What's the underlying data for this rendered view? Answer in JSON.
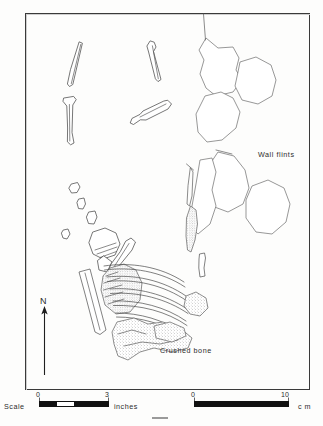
{
  "figure": {
    "type": "archaeological-site-plan",
    "title": "",
    "frame": {
      "x": 25,
      "y": 13,
      "width": 285,
      "height": 377
    }
  },
  "labels": {
    "wall_flints": "Wall flints",
    "crushed_bone": "Crushed bone",
    "north": "N"
  },
  "scale": {
    "word": "Scale",
    "imperial": {
      "unit": "inches",
      "min_tick": "0",
      "max_tick": "3",
      "ticks": [
        "0",
        "3"
      ]
    },
    "metric": {
      "unit": "c m",
      "min_tick": "0",
      "max_tick": "10",
      "ticks": [
        "0",
        "10"
      ]
    }
  },
  "legend_features": [
    {
      "name": "long-bone-fragment",
      "count": 4,
      "style": "outline"
    },
    {
      "name": "wall-flint-nodule",
      "count": 6,
      "style": "irregular-outline"
    },
    {
      "name": "rib-bone",
      "count": 7,
      "style": "curved-outline"
    },
    {
      "name": "crushed-bone-mass",
      "count": 3,
      "style": "stippled"
    },
    {
      "name": "small-bone-chip",
      "count": 5,
      "style": "outline"
    }
  ],
  "colors": {
    "ink": "#3a3a3a",
    "outline": "#4a4a4a",
    "flint_outline": "#6b6b6b",
    "stipple": "#5e5e5e",
    "paper": "#fdfdfc",
    "scalebar": "#111111"
  }
}
